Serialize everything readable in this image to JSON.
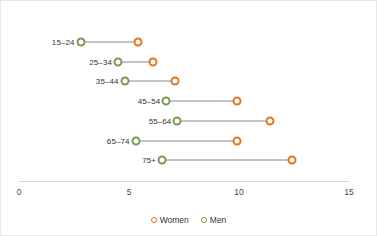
{
  "chart_data": {
    "type": "scatter",
    "subtype": "dumbbell",
    "title": "",
    "subtitle": "",
    "xlabel": "",
    "ylabel": "",
    "categories": [
      "15–24",
      "25–34",
      "35–44",
      "45–54",
      "55–64",
      "65–74",
      "75+"
    ],
    "series": [
      {
        "name": "Women",
        "color": "#e2761b",
        "values": [
          5.4,
          6.1,
          7.1,
          9.9,
          11.4,
          9.9,
          12.4
        ]
      },
      {
        "name": "Men",
        "color": "#7a9a4e",
        "values": [
          2.8,
          4.5,
          4.8,
          6.7,
          7.2,
          5.3,
          6.5
        ]
      }
    ],
    "xlim": [
      0,
      15
    ],
    "xticks": [
      0,
      5,
      10,
      15
    ],
    "xtick_labels": [
      "0",
      "5",
      "10",
      "15"
    ],
    "grid": false,
    "legend_position": "bottom",
    "connector_color": "#8a8a8a",
    "axis_color": "#d9d9d9"
  },
  "legend": {
    "items": [
      {
        "label": "Women",
        "key": "women"
      },
      {
        "label": "Men",
        "key": "men"
      }
    ]
  }
}
